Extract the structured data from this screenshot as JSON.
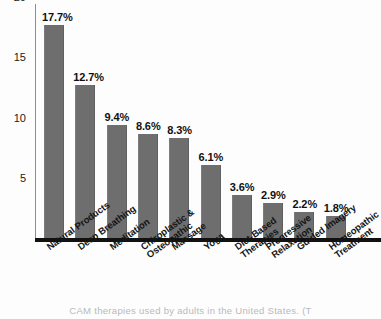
{
  "chart_data": {
    "type": "bar",
    "title": "",
    "xlabel": "",
    "ylabel": "",
    "ylim": [
      0,
      21.5
    ],
    "grid": false,
    "legend": null,
    "yticks": [
      5,
      10,
      15,
      20
    ],
    "ytick_labels": [
      "5",
      "10",
      "15",
      "20"
    ],
    "categories": [
      "Natural Products",
      "Deep Breathing",
      "Meditation",
      "Chiropłastic &\nOsteopathic",
      "Massage",
      "Yoga",
      "Diet-Based\nTherapies",
      "Progressive\nRelaxation",
      "Guided Imagery",
      "Homeopathic\nTreatment"
    ],
    "values": [
      17.7,
      12.7,
      9.4,
      8.6,
      8.3,
      6.1,
      3.6,
      2.9,
      2.2,
      1.8
    ],
    "data_labels": [
      "17.7%",
      "12.7%",
      "9.4%",
      "8.6%",
      "8.3%",
      "6.1%",
      "3.6%",
      "2.9%",
      "2.2%",
      "1.8%"
    ],
    "bar_color": "#6e6e6e",
    "axis_color": "#8d8d8d",
    "baseline_color": "#111111",
    "background_color": "#fdfdfd"
  },
  "bars": [
    {
      "label": "Natural Products",
      "label_line1": "Natural Products",
      "label_line2": "",
      "value": 17.7,
      "value_label": "17.7%"
    },
    {
      "label": "Deep Breathing",
      "label_line1": "Deep Breathing",
      "label_line2": "",
      "value": 12.7,
      "value_label": "12.7%"
    },
    {
      "label": "Meditation",
      "label_line1": "Meditation",
      "label_line2": "",
      "value": 9.4,
      "value_label": "9.4%"
    },
    {
      "label": "Chiroplastic & Osteopathic",
      "label_line1": "Chiroplastic &",
      "label_line2": "Osteopathic",
      "value": 8.6,
      "value_label": "8.6%"
    },
    {
      "label": "Massage",
      "label_line1": "Massage",
      "label_line2": "",
      "value": 8.3,
      "value_label": "8.3%"
    },
    {
      "label": "Yoga",
      "label_line1": "Yoga",
      "label_line2": "",
      "value": 6.1,
      "value_label": "6.1%"
    },
    {
      "label": "Diet-Based Therapies",
      "label_line1": "Diet-Based",
      "label_line2": "Therapies",
      "value": 3.6,
      "value_label": "3.6%"
    },
    {
      "label": "Progressive Relaxation",
      "label_line1": "Progressive",
      "label_line2": "Relaxation",
      "value": 2.9,
      "value_label": "2.9%"
    },
    {
      "label": "Guided Imagery",
      "label_line1": "Guided Imagery",
      "label_line2": "",
      "value": 2.2,
      "value_label": "2.2%"
    },
    {
      "label": "Homeopathic Treatment",
      "label_line1": "Homeopathic",
      "label_line2": "Treatment",
      "value": 1.8,
      "value_label": "1.8%"
    }
  ],
  "yticks": [
    {
      "label": "20",
      "value": 20
    },
    {
      "label": "15",
      "value": 15
    },
    {
      "label": "10",
      "value": 10
    },
    {
      "label": "5",
      "value": 5
    }
  ],
  "caption": {
    "text": "CAM therapies used by adults in the United States. (T"
  }
}
